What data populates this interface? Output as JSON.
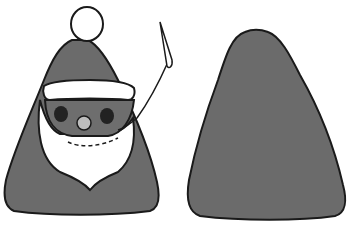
{
  "image": {
    "description": "Black-and-white illustration of a cone-shaped Santa figure holding a needle, next to a plain gray cone shape",
    "figures": [
      {
        "name": "santa-cone",
        "features": [
          "pompom",
          "hat-brim",
          "eyes",
          "nose",
          "beard",
          "needle-and-thread"
        ]
      },
      {
        "name": "plain-cone",
        "features": [
          "gray-fill"
        ]
      }
    ]
  },
  "colors": {
    "body_fill": "#6b6b6b",
    "face_fill": "#6e6e6e",
    "outline": "#1a1a1a",
    "white": "#ffffff",
    "nose": "#bdbdbd",
    "eyes": "#222222"
  }
}
